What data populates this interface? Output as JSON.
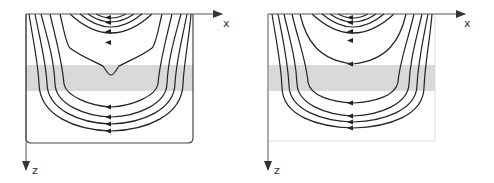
{
  "figure": {
    "colors": {
      "line": "#222222",
      "axis": "#555555",
      "band": "#d9d9d9",
      "left_box": "#444444",
      "right_box": "#dddddd"
    },
    "panels": [
      {
        "id": "left",
        "axis_x_label": "x",
        "axis_z_label": "z",
        "has_closed_boundary": true,
        "shaded_layer": true,
        "notch_in_innermost_open_line": true
      },
      {
        "id": "right",
        "axis_x_label": "x",
        "axis_z_label": "z",
        "has_closed_boundary": false,
        "shaded_layer": true,
        "notch_in_innermost_open_line": false
      }
    ]
  }
}
